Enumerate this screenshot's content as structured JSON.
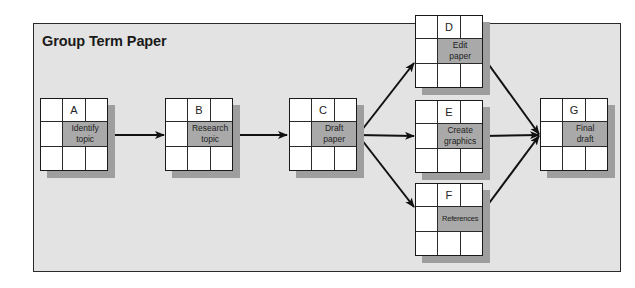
{
  "panel": {
    "title": "Group Term Paper"
  },
  "colors": {
    "panel_bg": "#e3e3e3",
    "task_cell": "#a9a9a9",
    "shadow": "#9e9e9e",
    "border": "#1a1a1a"
  },
  "nodes": [
    {
      "id": "A",
      "task_line1": "Identify",
      "task_line2": "topic"
    },
    {
      "id": "B",
      "task_line1": "Research",
      "task_line2": "topic"
    },
    {
      "id": "C",
      "task_line1": "Draft",
      "task_line2": "paper"
    },
    {
      "id": "D",
      "task_line1": "Edit",
      "task_line2": "paper"
    },
    {
      "id": "E",
      "task_line1": "Create",
      "task_line2": "graphics"
    },
    {
      "id": "F",
      "task_line1": "References",
      "task_line2": ""
    },
    {
      "id": "G",
      "task_line1": "Final",
      "task_line2": "draft"
    }
  ],
  "edges": [
    {
      "from": "A",
      "to": "B"
    },
    {
      "from": "B",
      "to": "C"
    },
    {
      "from": "C",
      "to": "D"
    },
    {
      "from": "C",
      "to": "E"
    },
    {
      "from": "C",
      "to": "F"
    },
    {
      "from": "D",
      "to": "G"
    },
    {
      "from": "E",
      "to": "G"
    },
    {
      "from": "F",
      "to": "G"
    }
  ]
}
